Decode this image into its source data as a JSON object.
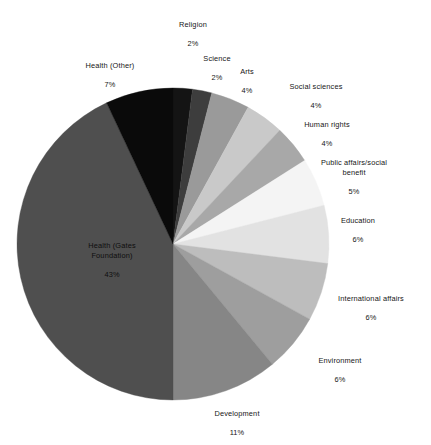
{
  "chart_data": {
    "type": "pie",
    "title": "",
    "subtitle": "",
    "xlabel": "",
    "ylabel": "",
    "legend_position": "none",
    "grid": false,
    "units": "percent",
    "start_angle_deg": 0,
    "direction": "clockwise",
    "categories": [
      "Religion",
      "Science",
      "Arts",
      "Social sciences",
      "Human rights",
      "Public affairs/social benefit",
      "Education",
      "International affairs",
      "Environment",
      "Development",
      "Health (Gates Foundation)",
      "Health (Other)"
    ],
    "values": [
      2,
      2,
      4,
      4,
      4,
      5,
      6,
      6,
      6,
      11,
      43,
      7
    ],
    "value_labels": [
      "2%",
      "2%",
      "4%",
      "4%",
      "4%",
      "5%",
      "6%",
      "6%",
      "6%",
      "11%",
      "43%",
      "7%"
    ],
    "colors": [
      "#141414",
      "#3d3d3d",
      "#9a9a9a",
      "#c9c9c9",
      "#a8a8a8",
      "#f4f4f4",
      "#e2e2e2",
      "#bdbdbd",
      "#9e9e9e",
      "#868686",
      "#4f4f4f",
      "#0a0a0a"
    ],
    "slices": [
      {
        "label": "Religion",
        "value": 2,
        "value_label": "2%",
        "color": "#141414",
        "label_line1": "Religion",
        "label_line2": "",
        "label_line3": "2%"
      },
      {
        "label": "Science",
        "value": 2,
        "value_label": "2%",
        "color": "#3d3d3d",
        "label_line1": "Science",
        "label_line2": "",
        "label_line3": "2%"
      },
      {
        "label": "Arts",
        "value": 4,
        "value_label": "4%",
        "color": "#9a9a9a",
        "label_line1": "Arts",
        "label_line2": "",
        "label_line3": "4%"
      },
      {
        "label": "Social sciences",
        "value": 4,
        "value_label": "4%",
        "color": "#c9c9c9",
        "label_line1": "Social sciences",
        "label_line2": "",
        "label_line3": "4%"
      },
      {
        "label": "Human rights",
        "value": 4,
        "value_label": "4%",
        "color": "#a8a8a8",
        "label_line1": "Human rights",
        "label_line2": "",
        "label_line3": "4%"
      },
      {
        "label": "Public affairs/social benefit",
        "value": 5,
        "value_label": "5%",
        "color": "#f4f4f4",
        "label_line1": "Public affairs/social",
        "label_line2": "benefit",
        "label_line3": "5%"
      },
      {
        "label": "Education",
        "value": 6,
        "value_label": "6%",
        "color": "#e2e2e2",
        "label_line1": "Education",
        "label_line2": "",
        "label_line3": "6%"
      },
      {
        "label": "International affairs",
        "value": 6,
        "value_label": "6%",
        "color": "#bdbdbd",
        "label_line1": "International affairs",
        "label_line2": "",
        "label_line3": "6%"
      },
      {
        "label": "Environment",
        "value": 6,
        "value_label": "6%",
        "color": "#9e9e9e",
        "label_line1": "Environment",
        "label_line2": "",
        "label_line3": "6%"
      },
      {
        "label": "Development",
        "value": 11,
        "value_label": "11%",
        "color": "#868686",
        "label_line1": "Development",
        "label_line2": "",
        "label_line3": "11%"
      },
      {
        "label": "Health (Gates Foundation)",
        "value": 43,
        "value_label": "43%",
        "color": "#4f4f4f",
        "label_line1": "Health (Gates",
        "label_line2": "Foundation)",
        "label_line3": "43%"
      },
      {
        "label": "Health (Other)",
        "value": 7,
        "value_label": "7%",
        "color": "#0a0a0a",
        "label_line1": "Health (Other)",
        "label_line2": "",
        "label_line3": "7%"
      }
    ]
  },
  "labels": {
    "religion": {
      "name": "Religion",
      "value": "2%"
    },
    "science": {
      "name": "Science",
      "value": "2%"
    },
    "arts": {
      "name": "Arts",
      "value": "4%"
    },
    "social_sci": {
      "name": "Social sciences",
      "value": "4%"
    },
    "human_rights": {
      "name": "Human rights",
      "value": "4%"
    },
    "public": {
      "name": "Public affairs/social\nbenefit",
      "value": "5%"
    },
    "education": {
      "name": "Education",
      "value": "6%"
    },
    "intl": {
      "name": "International affairs",
      "value": "6%"
    },
    "environment": {
      "name": "Environment",
      "value": "6%"
    },
    "development": {
      "name": "Development",
      "value": "11%"
    },
    "gates": {
      "name": "Health (Gates\nFoundation)",
      "value": "43%"
    },
    "health_other": {
      "name": "Health (Other)",
      "value": "7%"
    }
  },
  "geometry": {
    "center_x": 173,
    "center_y": 244,
    "radius": 156
  }
}
